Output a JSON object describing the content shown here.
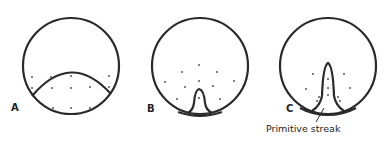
{
  "figure": {
    "panels": [
      {
        "id": "A",
        "label": "A"
      },
      {
        "id": "B",
        "label": "B"
      },
      {
        "id": "C",
        "label": "C",
        "annotation": "Primitive streak"
      }
    ],
    "colors": {
      "stroke": "#2a2a2a",
      "background": "#ffffff"
    }
  }
}
